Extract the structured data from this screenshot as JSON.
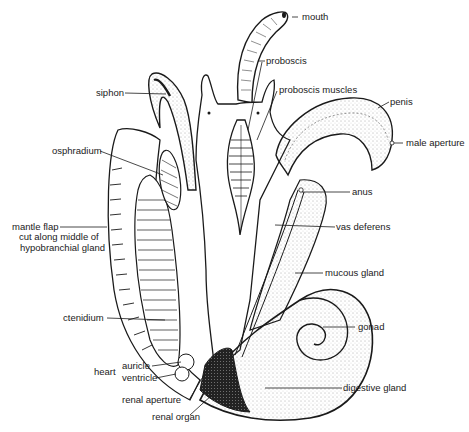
{
  "figure": {
    "title": "",
    "colors": {
      "ink": "#1a1a1a",
      "background": "#ffffff",
      "stipple": "#555555"
    }
  },
  "labels": {
    "mouth": "mouth",
    "proboscis": "proboscis",
    "proboscis_muscles": "proboscis muscles",
    "siphon": "siphon",
    "penis": "penis",
    "male_aperture": "male aperture",
    "osphradium": "osphradium",
    "anus": "anus",
    "mantle_flap_1": "mantle flap",
    "mantle_flap_2": "cut along middle of",
    "mantle_flap_3": "hypobranchial gland",
    "vas_deferens": "vas deferens",
    "mucous_gland": "mucous gland",
    "ctenidium": "ctenidium",
    "gonad": "gonad",
    "heart": "heart",
    "auricle": "auricle",
    "ventricle": "ventricle",
    "digestive_gland": "digestive gland",
    "renal_aperture": "renal aperture",
    "renal_organ": "renal organ"
  }
}
